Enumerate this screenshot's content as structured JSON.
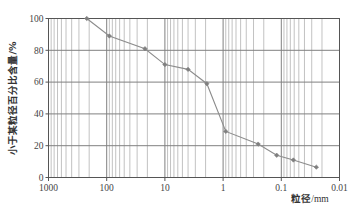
{
  "chart_data": {
    "type": "line",
    "title": "",
    "subtitle": "",
    "xlabel": "粒径/mm",
    "ylabel": "小于某粒径百分比含量/%",
    "xscale": "log",
    "x_axis_reversed": true,
    "xlim": [
      1000,
      0.01
    ],
    "ylim": [
      0,
      100
    ],
    "xticklabels": [
      "1000",
      "100",
      "10",
      "1",
      "0.1",
      "0.01"
    ],
    "xticks": [
      1000,
      100,
      10,
      1,
      0.1,
      0.01
    ],
    "yticklabels": [
      "0",
      "20",
      "40",
      "60",
      "80",
      "100"
    ],
    "yticks": [
      0,
      20,
      40,
      60,
      80,
      100
    ],
    "grid": {
      "major_x": true,
      "minor_x": true,
      "major_y": true,
      "minor_y": false
    },
    "legend": null,
    "legend_position": "none",
    "series": [
      {
        "name": "累计百分含量",
        "marker": "diamond",
        "color": "#8c8c8c",
        "x": [
          220,
          90,
          22,
          10,
          4.0,
          1.9,
          0.9,
          0.25,
          0.12,
          0.062,
          0.025
        ],
        "y": [
          100,
          89,
          81,
          71,
          68,
          59,
          29,
          21,
          14,
          11,
          6.5
        ]
      }
    ],
    "annotations": []
  },
  "axis": {
    "x_title_main": "粒径",
    "x_title_unit": "/mm",
    "y_title": "小于某粒径百分比含量/%"
  },
  "colors": {
    "series_line": "#9a9a9a",
    "series_marker": "#7f7f7f",
    "grid_major": "#808080",
    "grid_minor": "#a8a8a8",
    "axis_line": "#555555",
    "background": "#ffffff",
    "text": "#3a3a3a"
  }
}
